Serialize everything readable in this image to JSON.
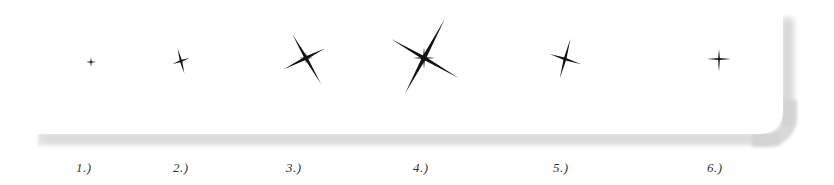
{
  "figure": {
    "colors": {
      "background": "#ffffff",
      "card": "#ffffff",
      "shadow": "#d2d2d2",
      "sparkle": "#111111",
      "label": "#333333"
    },
    "items": [
      {
        "label": "1.)",
        "icon": "sparkle-icon-small-cross",
        "cx": 91,
        "cy": 62,
        "label_x": 78
      },
      {
        "label": "2.)",
        "icon": "sparkle-icon-tilted-cross",
        "cx": 181,
        "cy": 61,
        "label_x": 175
      },
      {
        "label": "3.)",
        "icon": "sparkle-icon-star-medium",
        "cx": 306,
        "cy": 58,
        "label_x": 287
      },
      {
        "label": "4.)",
        "icon": "sparkle-icon-star-large",
        "cx": 424,
        "cy": 58,
        "label_x": 414
      },
      {
        "label": "5.)",
        "icon": "sparkle-icon-tilted-cross-medium",
        "cx": 565,
        "cy": 59,
        "label_x": 554
      },
      {
        "label": "6.)",
        "icon": "sparkle-icon-small-cross",
        "cx": 719,
        "cy": 58,
        "label_x": 708
      }
    ]
  }
}
